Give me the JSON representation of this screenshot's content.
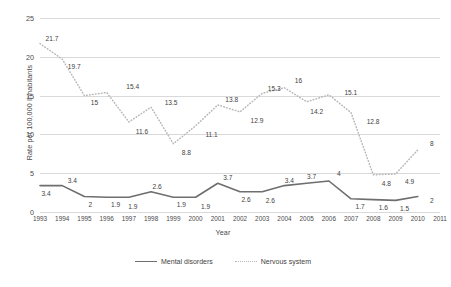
{
  "chart_data": {
    "type": "line",
    "title": "",
    "xlabel": "Year",
    "ylabel": "Rate per 100,000 Inhabitants",
    "categories": [
      "1993",
      "1994",
      "1995",
      "1996",
      "1997",
      "1998",
      "1999",
      "2000",
      "2001",
      "2002",
      "2003",
      "2004",
      "2005",
      "2006",
      "2007",
      "2008",
      "2009",
      "2010",
      "2011"
    ],
    "yticks": [
      "0",
      "5",
      "10",
      "15",
      "20",
      "25"
    ],
    "ylim": [
      0,
      25
    ],
    "grid": true,
    "legend_position": "bottom",
    "series": [
      {
        "name": "Mental disorders",
        "style": "solid",
        "color": "#6e6e6e",
        "values": [
          3.4,
          3.4,
          2,
          1.9,
          1.9,
          2.6,
          1.9,
          1.9,
          3.7,
          2.6,
          2.6,
          3.4,
          3.7,
          4,
          1.7,
          1.6,
          1.5,
          2,
          null
        ],
        "labels": [
          "3.4",
          "3.4",
          "2",
          "1.9",
          "1.9",
          "2.6",
          "1.9",
          "1.9",
          "3.7",
          "2.6",
          "2.6",
          "3.4",
          "3.7",
          "4",
          "1.7",
          "1.6",
          "1.5",
          "2",
          ""
        ]
      },
      {
        "name": "Nervous system",
        "style": "dotted",
        "color": "#b7b7b7",
        "values": [
          21.7,
          19.7,
          15,
          15.4,
          11.6,
          13.5,
          8.8,
          11.1,
          13.8,
          12.9,
          15.3,
          16,
          14.2,
          15.1,
          12.8,
          4.8,
          4.9,
          8,
          null
        ],
        "labels": [
          "21.7",
          "19.7",
          "15",
          "15.4",
          "11.6",
          "13.5",
          "8.8",
          "11.1",
          "13.8",
          "12.9",
          "15.3",
          "16",
          "14.2",
          "15.1",
          "12.8",
          "4.8",
          "4.9",
          "8",
          ""
        ]
      }
    ]
  },
  "legend": {
    "items": [
      {
        "label": "Mental disorders"
      },
      {
        "label": "Nervous system"
      }
    ]
  }
}
